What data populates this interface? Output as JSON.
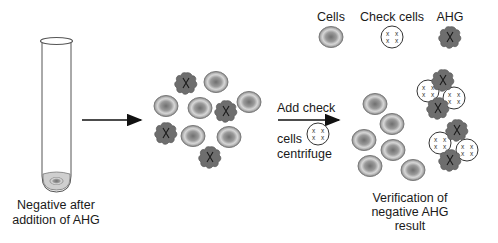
{
  "legend": {
    "cells_label": "Cells",
    "check_cells_label": "Check cells",
    "ahg_label": "AHG"
  },
  "tube": {
    "caption_line1": "Negative after",
    "caption_line2": "addition of AHG"
  },
  "step_arrow": {
    "line1": "Add check",
    "line2": "cells",
    "line3": "centrifuge"
  },
  "result": {
    "caption_line1": "Verification of",
    "caption_line2": "negative AHG",
    "caption_line3": "result"
  },
  "colors": {
    "cell_outer": "#8a8a8a",
    "cell_ring": "#d4d4d4",
    "cell_center": "#7a7a7a",
    "ahg_fill": "#6e6e6e",
    "ink": "#1a1a1a"
  },
  "middle_cluster": {
    "cells": [
      [
        216,
        82
      ],
      [
        166,
        106
      ],
      [
        200,
        108
      ],
      [
        249,
        102
      ],
      [
        193,
        136
      ],
      [
        229,
        137
      ]
    ],
    "ahg": [
      [
        186,
        83
      ],
      [
        226,
        111
      ],
      [
        166,
        133
      ],
      [
        210,
        157
      ]
    ]
  },
  "right_cluster": {
    "cells": [
      [
        375,
        104
      ],
      [
        392,
        124
      ],
      [
        364,
        140
      ],
      [
        393,
        150
      ],
      [
        370,
        166
      ],
      [
        413,
        170
      ]
    ],
    "check_cells": [
      [
        428,
        91
      ],
      [
        454,
        98
      ],
      [
        440,
        143
      ],
      [
        467,
        150
      ]
    ],
    "ahg": [
      [
        443,
        80
      ],
      [
        438,
        108
      ],
      [
        457,
        130
      ],
      [
        450,
        160
      ]
    ]
  }
}
